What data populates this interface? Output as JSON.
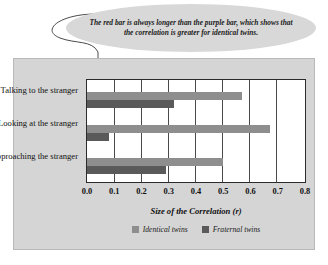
{
  "callout": {
    "text": "The red bar is always longer than the purple bar, which shows that the correlation is greater for identical twins."
  },
  "chart_data": {
    "type": "bar",
    "orientation": "horizontal",
    "title": "",
    "xlabel": "Size of the Correlation (r)",
    "ylabel": "",
    "xlim": [
      0.0,
      0.8
    ],
    "xticks": [
      "0.0",
      "0.1",
      "0.2",
      "0.3",
      "0.4",
      "0.5",
      "0.6",
      "0.7",
      "0.8"
    ],
    "grid": true,
    "legend_position": "bottom",
    "categories": [
      "Talking to the stranger",
      "Looking at the stranger",
      "Approaching the stranger"
    ],
    "series": [
      {
        "name": "Identical twins",
        "color": "#8e8e8e",
        "values": [
          0.57,
          0.67,
          0.5
        ]
      },
      {
        "name": "Fraternal twins",
        "color": "#5a5a5a",
        "values": [
          0.32,
          0.08,
          0.29
        ]
      }
    ]
  },
  "colors": {
    "panel_background": "#d5d5d5",
    "plot_background": "#ffffff",
    "axis": "#2b2b2b",
    "gridline": "#4a4a4a",
    "callout_background": "#d8d8d8"
  }
}
